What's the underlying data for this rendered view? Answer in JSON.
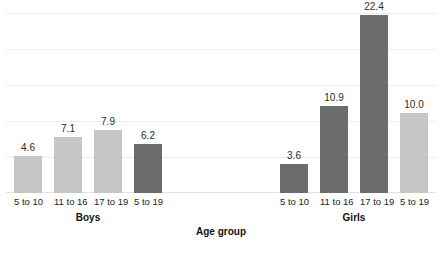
{
  "chart_data": {
    "type": "bar",
    "title": "",
    "subtitle": "",
    "xlabel": "Age group",
    "ylabel": "",
    "ylim": [
      0,
      27
    ],
    "grid": true,
    "gridlines": [
      0,
      4.5,
      9,
      13.5,
      18,
      22.5,
      27
    ],
    "legend": "none",
    "y_tick_labels": [],
    "categories": [
      "5 to 10",
      "11 to 16",
      "17 to 19",
      "5 to 19"
    ],
    "groups": [
      {
        "name": "Boys",
        "bars": [
          {
            "category": "5 to 10",
            "value": 4.6,
            "label": "4.6",
            "shade": "light"
          },
          {
            "category": "11 to 16",
            "value": 7.1,
            "label": "7.1",
            "shade": "light"
          },
          {
            "category": "17 to 19",
            "value": 7.9,
            "label": "7.9",
            "shade": "light"
          },
          {
            "category": "5 to 19",
            "value": 6.2,
            "label": "6.2",
            "shade": "dark"
          }
        ]
      },
      {
        "name": "Girls",
        "bars": [
          {
            "category": "5 to 10",
            "value": 3.6,
            "label": "3.6",
            "shade": "dark"
          },
          {
            "category": "11 to 16",
            "value": 10.9,
            "label": "10.9",
            "shade": "dark"
          },
          {
            "category": "17 to 19",
            "value": 22.4,
            "label": "22.4",
            "shade": "dark"
          },
          {
            "category": "5 to 19",
            "value": 10.0,
            "label": "10.0",
            "shade": "light"
          }
        ]
      }
    ],
    "colors": {
      "bar_light": "#c6c6c6",
      "bar_dark": "#6c6c6c",
      "gridline": "#ececec",
      "text": "#1d1d1d",
      "background": "#ffffff"
    }
  }
}
